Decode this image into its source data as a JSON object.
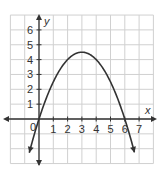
{
  "chart_data": {
    "type": "line",
    "title": "",
    "xlabel": "x",
    "ylabel": "y",
    "xlim": [
      -2,
      8
    ],
    "ylim": [
      -3,
      7
    ],
    "grid": true,
    "x_ticks": [
      "1",
      "2",
      "3",
      "4",
      "5",
      "6",
      "7"
    ],
    "y_ticks": [
      "1",
      "2",
      "3",
      "4",
      "5",
      "6"
    ],
    "origin_label": "0",
    "series": [
      {
        "name": "parabola",
        "equation": "y = -0.5x^2 + 3x",
        "x": [
          -0.7,
          0,
          1,
          2,
          3,
          4,
          5,
          6,
          6.7
        ],
        "y": [
          -2.35,
          0,
          2.5,
          4,
          4.5,
          4,
          2.5,
          0,
          -2.35
        ],
        "vertex": [
          3,
          4.5
        ],
        "x_intercepts": [
          0,
          6
        ],
        "color": "#333333"
      }
    ]
  }
}
